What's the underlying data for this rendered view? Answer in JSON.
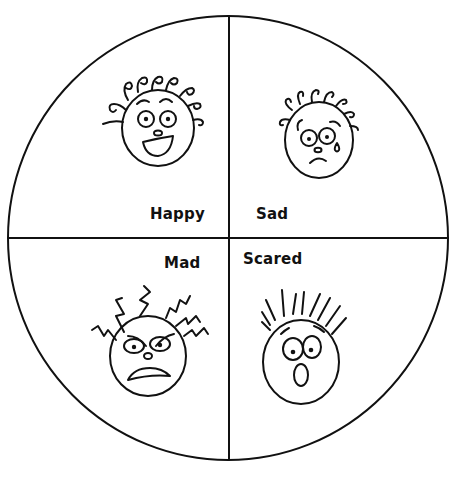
{
  "diagram": {
    "type": "feelings-wheel",
    "quadrant_count": 4,
    "colors": {
      "ink": "#111111",
      "background": "#ffffff"
    },
    "quadrants": [
      {
        "position": "top-left",
        "label": "Happy",
        "face": "happy-face-curly-hair-open-smile"
      },
      {
        "position": "top-right",
        "label": "Sad",
        "face": "sad-face-curly-hair-tear-frown"
      },
      {
        "position": "bottom-left",
        "label": "Mad",
        "face": "mad-face-zigzag-hair-angry-brows"
      },
      {
        "position": "bottom-right",
        "label": "Scared",
        "face": "scared-face-spiky-hair-open-mouth"
      }
    ]
  }
}
